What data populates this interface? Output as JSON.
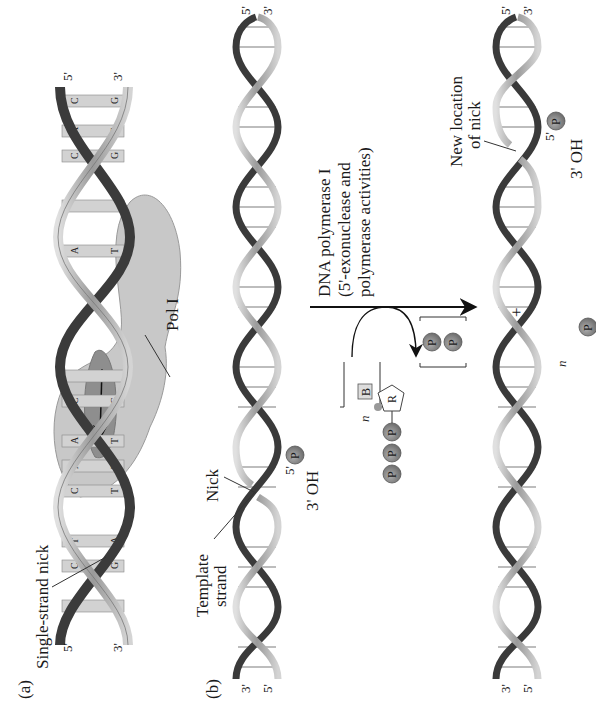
{
  "figure": {
    "orientation": "rotated 90 degrees counter-clockwise",
    "panel_a": {
      "label": "(a)",
      "nick_label": "Single-strand nick",
      "enzyme_label": "Pol I",
      "left_top_end": "5'",
      "left_bottom_end": "3'",
      "right_top_end": "5'",
      "right_bottom_end": "3'",
      "top_strand_bases": [
        "G",
        "C",
        "T",
        "C",
        "A",
        "A",
        "C",
        "A",
        "C",
        "A",
        "C"
      ],
      "bottom_strand_bases": [
        "C",
        "G",
        "A",
        "T",
        "T",
        "T",
        "G",
        "T",
        "G",
        "T",
        "G"
      ]
    },
    "panel_b": {
      "label": "(b)",
      "template_label_line1": "Template",
      "template_label_line2": "strand",
      "nick_label": "Nick",
      "five_prime_label": "5'",
      "phosphate_label": "P",
      "three_oh_label": "3' OH",
      "top_helix_left_ends": [
        "3'",
        "5'"
      ],
      "top_helix_right_ends": [
        "5'",
        "3'"
      ],
      "reaction": {
        "enzyme_line1": "DNA polymerase I",
        "enzyme_line2": "(5'-exonuclease and",
        "enzyme_line3": "polymerase activities)",
        "substrate_multiplier": "n",
        "substrate_phosphates": [
          "P",
          "P",
          "P"
        ],
        "substrate_base": "B",
        "substrate_sugar": "R",
        "product_multiplier": "n",
        "product_phosphate": "P",
        "product_base": "B",
        "product_sugar": "R",
        "plus_sign": "+",
        "pyrophosphate": [
          "P",
          "P"
        ]
      },
      "new_nick_line1": "New location",
      "new_nick_line2": "of nick",
      "new_five_prime_label": "5'",
      "new_phosphate_label": "P",
      "new_three_oh_label": "3' OH",
      "bottom_helix_left_ends": [
        "3'",
        "5'"
      ],
      "bottom_helix_right_ends": [
        "5'",
        "3'"
      ]
    }
  },
  "colors": {
    "strand_light": "#b8b8b8",
    "strand_dark": "#3a3a3a",
    "base_pair": "#d0d0d0",
    "pol_body": "#c4c4c4",
    "pol_active": "#8c8c8c",
    "phosphate": "#8a8a8a",
    "text": "#1a1a1a"
  }
}
